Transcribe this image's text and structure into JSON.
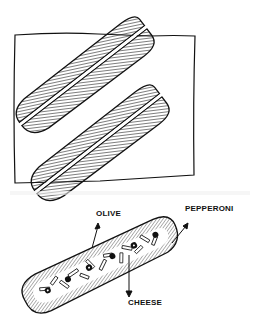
{
  "figure": {
    "labels": {
      "olive": "OLIVE",
      "pepperoni": "PEPPERONI",
      "cheese": "CHEESE"
    },
    "colors": {
      "ink": "#111111",
      "background": "#ffffff"
    }
  }
}
